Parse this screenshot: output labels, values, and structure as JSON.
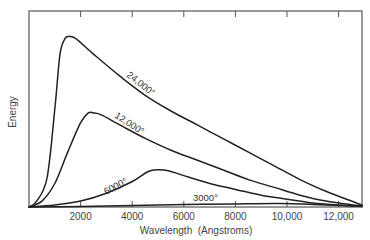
{
  "chart_data": {
    "type": "line",
    "title": "",
    "xlabel": "Wavelength (Angstroms)",
    "ylabel": "Energy",
    "xlim": [
      0,
      12900
    ],
    "ylim": [
      0,
      100
    ],
    "x_ticks": [
      2000,
      4000,
      6000,
      8000,
      10000,
      12000
    ],
    "x_tick_labels": [
      "2000",
      "4000",
      "6000",
      "8000",
      "10,000",
      "12,000"
    ],
    "y_ticks": [],
    "grid": false,
    "legend": "none (inline curve labels)",
    "series": [
      {
        "name": "24,000°",
        "label": "24,000°",
        "points": [
          [
            0,
            0
          ],
          [
            300,
            3
          ],
          [
            700,
            15
          ],
          [
            1000,
            50
          ],
          [
            1200,
            78
          ],
          [
            1400,
            86
          ],
          [
            1550,
            87
          ],
          [
            1800,
            86
          ],
          [
            2500,
            78
          ],
          [
            3500,
            67
          ],
          [
            4500,
            57
          ],
          [
            5500,
            49
          ],
          [
            6500,
            42
          ],
          [
            7500,
            35
          ],
          [
            8500,
            28
          ],
          [
            9500,
            21
          ],
          [
            10500,
            14
          ],
          [
            11500,
            8
          ],
          [
            12300,
            4
          ],
          [
            12900,
            1
          ]
        ]
      },
      {
        "name": "12,000°",
        "label": "12,000°",
        "points": [
          [
            0,
            0
          ],
          [
            500,
            3
          ],
          [
            1000,
            12
          ],
          [
            1500,
            28
          ],
          [
            2000,
            43
          ],
          [
            2300,
            48
          ],
          [
            2500,
            48
          ],
          [
            2800,
            47
          ],
          [
            3500,
            42
          ],
          [
            4500,
            35
          ],
          [
            5500,
            29
          ],
          [
            6500,
            24
          ],
          [
            7500,
            19
          ],
          [
            8500,
            14
          ],
          [
            9500,
            10
          ],
          [
            10500,
            6
          ],
          [
            11500,
            3
          ],
          [
            12300,
            1.5
          ],
          [
            12900,
            0.5
          ]
        ]
      },
      {
        "name": "6000°",
        "label": "6000°",
        "points": [
          [
            0,
            0
          ],
          [
            1000,
            1
          ],
          [
            2000,
            3
          ],
          [
            3000,
            7
          ],
          [
            4000,
            13
          ],
          [
            4600,
            18
          ],
          [
            5000,
            19
          ],
          [
            5400,
            18.5
          ],
          [
            6000,
            16
          ],
          [
            7000,
            12
          ],
          [
            8000,
            9
          ],
          [
            9000,
            6
          ],
          [
            10000,
            4
          ],
          [
            11000,
            2
          ],
          [
            12000,
            1
          ],
          [
            12900,
            0.3
          ]
        ]
      },
      {
        "name": "3000°",
        "label": "3000°",
        "points": [
          [
            0,
            0
          ],
          [
            2000,
            0.3
          ],
          [
            4000,
            0.8
          ],
          [
            6000,
            1.2
          ],
          [
            8000,
            1.6
          ],
          [
            9700,
            1.8
          ],
          [
            11000,
            1.3
          ],
          [
            12000,
            0.8
          ],
          [
            12900,
            0.4
          ]
        ]
      }
    ],
    "annotations": [
      {
        "text": "24,000°",
        "x": 3900,
        "y": 66,
        "rotate": 38
      },
      {
        "text": "12,000°",
        "x": 3900,
        "y": 40,
        "rotate": 32
      },
      {
        "text": "6000°",
        "x": 3000,
        "y": 9,
        "rotate": -28
      },
      {
        "text": "3000°",
        "x": 6800,
        "y": 3,
        "rotate": 0
      }
    ]
  },
  "labels": {
    "xlabel": "Wavelength  (Angstroms)",
    "ylabel": "Energy",
    "curve_24000": "24,000°",
    "curve_12000": "12,000°",
    "curve_6000": "6000°",
    "curve_3000": "3000°",
    "tick_2000": "2000",
    "tick_4000": "4000",
    "tick_6000": "6000",
    "tick_8000": "8000",
    "tick_10000": "10,000",
    "tick_12000": "12,000"
  },
  "colors": {
    "curve": "#222222",
    "frame": "#555555",
    "text": "#444444",
    "background": "#ffffff"
  }
}
